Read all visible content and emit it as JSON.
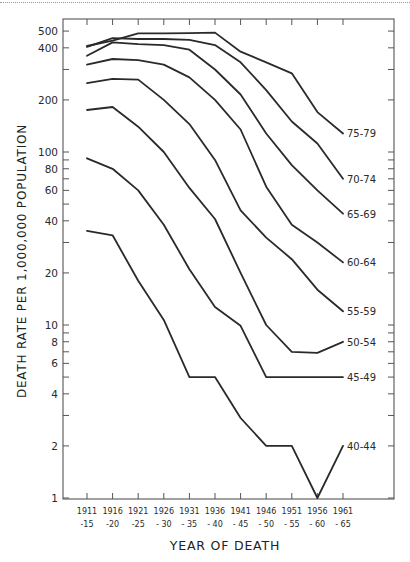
{
  "chart_data": {
    "type": "line",
    "title": "",
    "xlabel": "YEAR OF DEATH",
    "ylabel": "DEATH RATE PER 1,000,000 POPULATION",
    "yscale": "log",
    "ylim": [
      1,
      600
    ],
    "grid": false,
    "legend_position": "inline-right-labels",
    "categories": [
      "1911-15",
      "1916-20",
      "1921-25",
      "1926-30",
      "1931-35",
      "1936-40",
      "1941-45",
      "1946-50",
      "1951-55",
      "1956-60",
      "1961-65"
    ],
    "x_tick_labels": [
      {
        "top": "1911",
        "bottom": "-15"
      },
      {
        "top": "1916",
        "bottom": "-20"
      },
      {
        "top": "1921",
        "bottom": "-25"
      },
      {
        "top": "1926",
        "bottom": "- 30"
      },
      {
        "top": "1931",
        "bottom": "- 35"
      },
      {
        "top": "1936",
        "bottom": "- 40"
      },
      {
        "top": "1941",
        "bottom": "- 45"
      },
      {
        "top": "1946",
        "bottom": "- 50"
      },
      {
        "top": "1951",
        "bottom": "- 55"
      },
      {
        "top": "1956",
        "bottom": "- 60"
      },
      {
        "top": "1961",
        "bottom": "- 65"
      }
    ],
    "y_ticks_labeled": [
      1,
      2,
      4,
      6,
      8,
      10,
      20,
      40,
      60,
      80,
      100,
      200,
      400,
      500
    ],
    "y_tick_labels": [
      "1",
      "2",
      "4",
      "6",
      "8",
      "10",
      "20",
      "40",
      "60",
      "80",
      "100",
      "200",
      "400",
      "500"
    ],
    "y_ticks_minor": [
      3,
      5,
      7,
      9,
      30,
      50,
      70,
      90,
      300
    ],
    "series": [
      {
        "name": "75-79",
        "values": [
          410,
          440,
          485,
          485,
          487,
          490,
          380,
          330,
          285,
          170,
          128
        ]
      },
      {
        "name": "70-74",
        "values": [
          405,
          455,
          450,
          450,
          445,
          415,
          330,
          228,
          150,
          112,
          70
        ]
      },
      {
        "name": "65-69",
        "values": [
          360,
          430,
          420,
          415,
          390,
          300,
          215,
          128,
          84,
          60,
          44
        ]
      },
      {
        "name": "60-64",
        "values": [
          320,
          345,
          340,
          320,
          270,
          200,
          135,
          63,
          38,
          30,
          23
        ]
      },
      {
        "name": "55-59",
        "values": [
          250,
          265,
          262,
          200,
          145,
          90,
          46,
          32,
          24,
          16,
          12
        ]
      },
      {
        "name": "50-54",
        "values": [
          175,
          182,
          140,
          100,
          62,
          41,
          20,
          10,
          7,
          6.9,
          8
        ]
      },
      {
        "name": "45-49",
        "values": [
          92,
          80,
          60,
          38,
          21,
          12.7,
          9.9,
          5,
          5,
          5,
          5
        ]
      },
      {
        "name": "40-44",
        "values": [
          35,
          33,
          18,
          10.7,
          5,
          5,
          2.9,
          2,
          2,
          1,
          2
        ]
      }
    ]
  },
  "axis_titles": {
    "x": "YEAR OF DEATH",
    "y": "DEATH RATE PER 1,000,000 POPULATION"
  }
}
